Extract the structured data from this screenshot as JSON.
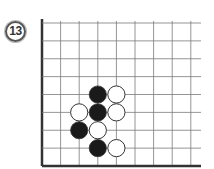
{
  "problem": {
    "number": "13"
  },
  "board": {
    "columns": 9,
    "rows": 9,
    "edges": [
      "left",
      "bottom"
    ],
    "colors": {
      "line": "#7a7a7a",
      "edge": "#333333",
      "black_stone": "#1a1a1a",
      "white_stone": "#ffffff",
      "stone_outline": "#333333"
    },
    "stones": [
      {
        "color": "black",
        "col": 3,
        "row": 4
      },
      {
        "color": "white",
        "col": 4,
        "row": 4
      },
      {
        "color": "white",
        "col": 2,
        "row": 5
      },
      {
        "color": "black",
        "col": 3,
        "row": 5
      },
      {
        "color": "white",
        "col": 4,
        "row": 5
      },
      {
        "color": "black",
        "col": 2,
        "row": 6
      },
      {
        "color": "white",
        "col": 3,
        "row": 6
      },
      {
        "color": "black",
        "col": 3,
        "row": 7
      },
      {
        "color": "white",
        "col": 4,
        "row": 7
      }
    ]
  }
}
